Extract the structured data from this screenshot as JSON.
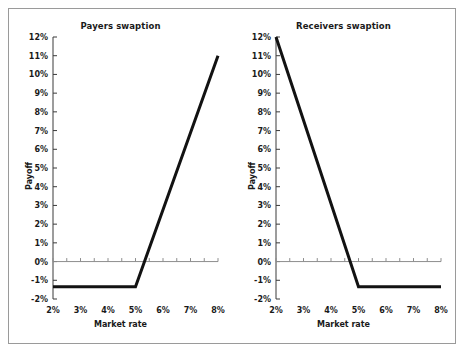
{
  "figure": {
    "background": "#ffffff",
    "border_color": "#9a9a9a"
  },
  "chart_data": [
    {
      "type": "line",
      "title": "Payers swaption",
      "xlabel": "Market rate",
      "ylabel": "Payoff",
      "xlim": [
        2,
        8
      ],
      "ylim": [
        -2,
        12
      ],
      "x_ticks": [
        2,
        3,
        4,
        5,
        6,
        7,
        8
      ],
      "x_tick_labels": [
        "2%",
        "3%",
        "4%",
        "5%",
        "6%",
        "7%",
        "8%"
      ],
      "y_ticks": [
        -2,
        -1,
        0,
        1,
        2,
        3,
        4,
        5,
        6,
        7,
        8,
        9,
        10,
        11,
        12
      ],
      "y_tick_labels": [
        "-2%",
        "-1%",
        "0%",
        "1%",
        "2%",
        "3%",
        "4%",
        "5%",
        "6%",
        "7%",
        "8%",
        "9%",
        "10%",
        "11%",
        "12%"
      ],
      "grid": false,
      "legend": "none",
      "zero_line": true,
      "strike": 5,
      "premium": -1.35,
      "series": [
        {
          "name": "Payers swaption payoff",
          "color": "#121212",
          "x": [
            2,
            5,
            8
          ],
          "values": [
            -1.35,
            -1.35,
            11.0
          ]
        }
      ]
    },
    {
      "type": "line",
      "title": "Receivers swaption",
      "xlabel": "Market rate",
      "ylabel": "Payoff",
      "xlim": [
        2,
        8
      ],
      "ylim": [
        -2,
        12
      ],
      "x_ticks": [
        2,
        3,
        4,
        5,
        6,
        7,
        8
      ],
      "x_tick_labels": [
        "2%",
        "3%",
        "4%",
        "5%",
        "6%",
        "7%",
        "8%"
      ],
      "y_ticks": [
        -2,
        -1,
        0,
        1,
        2,
        3,
        4,
        5,
        6,
        7,
        8,
        9,
        10,
        11,
        12
      ],
      "y_tick_labels": [
        "-2%",
        "-1%",
        "0%",
        "1%",
        "2%",
        "3%",
        "4%",
        "5%",
        "6%",
        "7%",
        "8%",
        "9%",
        "10%",
        "11%",
        "12%"
      ],
      "grid": false,
      "legend": "none",
      "zero_line": true,
      "strike": 5,
      "premium": -1.35,
      "series": [
        {
          "name": "Receivers swaption payoff",
          "color": "#121212",
          "x": [
            2,
            5,
            8
          ],
          "values": [
            12.0,
            -1.35,
            -1.35
          ]
        }
      ]
    }
  ]
}
